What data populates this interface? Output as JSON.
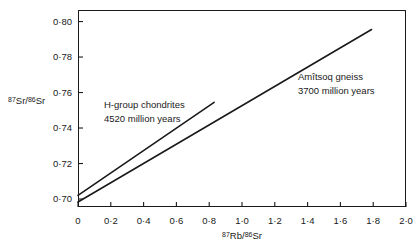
{
  "chart_data": {
    "type": "line",
    "title": "",
    "subtitle": "",
    "xlabel": "87Rb/86Sr",
    "ylabel": "87Sr/86Sr",
    "xlabel_parts": {
      "sup1": "87",
      "mid": "Rb/",
      "sup2": "86",
      "tail": "Sr"
    },
    "ylabel_parts": {
      "sup1": "87",
      "mid": "Sr/",
      "sup2": "86",
      "tail": "Sr"
    },
    "xlim": [
      0,
      2.0
    ],
    "ylim": [
      0.6955,
      0.8065
    ],
    "xticks": [
      0,
      0.2,
      0.4,
      0.6,
      0.8,
      1.0,
      1.2,
      1.4,
      1.6,
      1.8,
      2.0
    ],
    "xtick_labels": [
      "0",
      "0·2",
      "0·4",
      "0·6",
      "0·8",
      "1·0",
      "1·2",
      "1·4",
      "1·6",
      "1·8",
      "2·0"
    ],
    "yticks": [
      0.7,
      0.72,
      0.74,
      0.76,
      0.78,
      0.8
    ],
    "ytick_labels": [
      "0·70",
      "0·72",
      "0·74",
      "0·76",
      "0·78",
      "0·80"
    ],
    "grid": false,
    "legend_position": "none",
    "tick_direction": "in",
    "series": [
      {
        "name": "H-group chondrites",
        "age_label": "4520 million years",
        "color": "#1a1a1a",
        "intercept": 0.702,
        "slope": 0.0632,
        "x": [
          0,
          0.83
        ],
        "y": [
          0.702,
          0.7545
        ]
      },
      {
        "name": "Amîtsoq gneiss",
        "age_label": "3700 million years",
        "color": "#1a1a1a",
        "intercept": 0.6983,
        "slope": 0.0543,
        "x": [
          0,
          1.79
        ],
        "y": [
          0.6983,
          0.7955
        ]
      }
    ],
    "annotations": [
      {
        "id": "chondrites",
        "line1": "H-group chondrites",
        "line2": "4520 million years"
      },
      {
        "id": "amitsoq",
        "line1": "Amîtsoq gneiss",
        "line2": "3700 million years"
      }
    ],
    "colors": {
      "axis": "#1a1a1a",
      "line": "#1a1a1a",
      "background": "#ffffff",
      "text": "#1a1a1a"
    }
  }
}
